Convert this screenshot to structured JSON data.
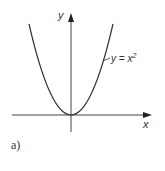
{
  "figure": {
    "caption": "a)",
    "x_axis_label": "x",
    "y_axis_label": "y",
    "curve_label": "y = x",
    "curve_label_exponent": "2",
    "curve_equation": "y = x^2",
    "colors": {
      "curve": "#333333",
      "axes": "#444444",
      "background": "#ffffff"
    }
  }
}
